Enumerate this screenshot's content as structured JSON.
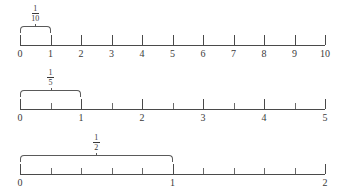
{
  "figure": {
    "ink_color": "#4a4a4a",
    "background": "#ffffff"
  },
  "lines": [
    {
      "id": "line-1",
      "fraction": {
        "numerator": "1",
        "denominator": "10",
        "display": "1/10"
      },
      "min": 0,
      "max": 10,
      "major_labels": [
        "0",
        "1",
        "2",
        "3",
        "4",
        "5",
        "6",
        "7",
        "8",
        "9",
        "10"
      ],
      "major_values": [
        0,
        1,
        2,
        3,
        4,
        5,
        6,
        7,
        8,
        9,
        10
      ],
      "minor_values": [],
      "bracket_from": 0,
      "bracket_to": 1,
      "axis_y": 45,
      "x_start": 20,
      "x_end": 325
    },
    {
      "id": "line-2",
      "fraction": {
        "numerator": "1",
        "denominator": "5",
        "display": "1/5"
      },
      "min": 0,
      "max": 5,
      "major_labels": [
        "0",
        "1",
        "2",
        "3",
        "4",
        "5"
      ],
      "major_values": [
        0,
        1,
        2,
        3,
        4,
        5
      ],
      "minor_values": [
        0.5,
        1.5,
        2.5,
        3.5,
        4.5
      ],
      "bracket_from": 0,
      "bracket_to": 1,
      "axis_y": 45,
      "x_start": 20,
      "x_end": 325
    },
    {
      "id": "line-3",
      "fraction": {
        "numerator": "1",
        "denominator": "2",
        "display": "1/2"
      },
      "min": 0,
      "max": 2,
      "major_labels": [
        "0",
        "1",
        "2"
      ],
      "major_values": [
        0,
        1,
        2
      ],
      "minor_values": [
        0.2,
        0.4,
        0.6,
        0.8,
        1.2,
        1.4,
        1.6,
        1.8
      ],
      "bracket_from": 0,
      "bracket_to": 1,
      "axis_y": 46,
      "x_start": 20,
      "x_end": 325
    }
  ]
}
